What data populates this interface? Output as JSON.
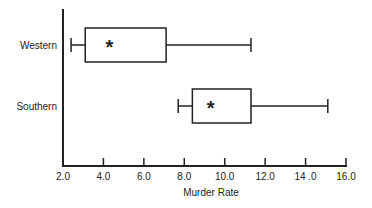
{
  "chart_data": {
    "type": "boxplot",
    "title": "",
    "xlabel": "Murder Rate",
    "ylabel": "",
    "xlim": [
      2.0,
      16.0
    ],
    "x_ticks": [
      "2.0",
      "4.0",
      "6.0",
      "8.0",
      "10.0",
      "12.0",
      "14 .0",
      "16.0"
    ],
    "x_tick_values": [
      2,
      4,
      6,
      8,
      10,
      12,
      14,
      16
    ],
    "grid": false,
    "legend": null,
    "orientation": "horizontal",
    "mean_marker": "*",
    "categories": [
      "Western",
      "Southern"
    ],
    "series": [
      {
        "name": "Western",
        "whisker_low": 2.4,
        "q1": 3.1,
        "q3": 7.1,
        "whisker_high": 11.3,
        "mean": 4.3
      },
      {
        "name": "Southern",
        "whisker_low": 7.7,
        "q1": 8.4,
        "q3": 11.3,
        "whisker_high": 15.1,
        "mean": 9.3
      }
    ]
  },
  "colors": {
    "line": "#222222",
    "background": "#ffffff"
  }
}
